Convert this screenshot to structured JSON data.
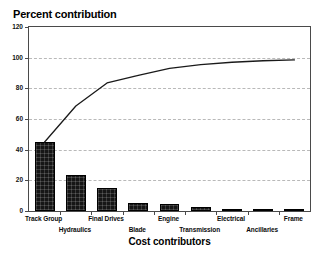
{
  "chart_data": {
    "type": "bar",
    "title": "Percent contribution",
    "xlabel": "Cost contributors",
    "ylabel": "",
    "categories": [
      "Track Group",
      "Hydraulics",
      "Final Drives",
      "Blade",
      "Engine",
      "Transmission",
      "Electrical",
      "Ancillaries",
      "Frame"
    ],
    "values": [
      45,
      23.5,
      15,
      5,
      4.5,
      2.5,
      1.5,
      1,
      0.5
    ],
    "series": [
      {
        "name": "Percent contribution",
        "type": "bar",
        "values": [
          45,
          23.5,
          15,
          5,
          4.5,
          2.5,
          1.5,
          1,
          0.5
        ]
      },
      {
        "name": "Cumulative percent",
        "type": "line",
        "values": [
          45,
          68.5,
          83.5,
          88.5,
          93,
          95.5,
          97,
          98,
          98.5
        ]
      }
    ],
    "cumulative": [
      45,
      68.5,
      83.5,
      88.5,
      93,
      95.5,
      97,
      98,
      98.5
    ],
    "ylim": [
      0,
      120
    ],
    "yticks": [
      0,
      20,
      40,
      60,
      80,
      100,
      120
    ],
    "ytick_labels": [
      "0",
      "20",
      "40",
      "60",
      "80",
      "100",
      "120"
    ],
    "grid": true,
    "grid_axis": "y",
    "legend": false,
    "legend_position": "none",
    "bar_color": "#161616",
    "line_color": "#1a1a1a",
    "grid_color": "#b9b9b9",
    "axis_color": "#4a4a4a",
    "background": "#ffffff",
    "label_rows": [
      0,
      1,
      0,
      1,
      0,
      1,
      0,
      1,
      0
    ],
    "annotations": []
  }
}
